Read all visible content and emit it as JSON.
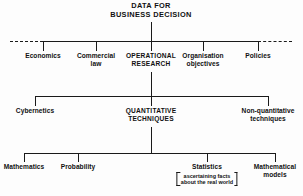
{
  "diagram": {
    "line_color": "#1a1a1a",
    "background": "#fdfdfd",
    "root": {
      "line1": "DATA FOR",
      "line2": "BUSINESS DECISION"
    },
    "level1": {
      "items": [
        {
          "line1": "Economics",
          "line2": ""
        },
        {
          "line1": "Commercial",
          "line2": "law"
        },
        {
          "line1": "OPERATIONAL",
          "line2": "RESEARCH"
        },
        {
          "line1": "Organisation",
          "line2": "objectives"
        },
        {
          "line1": "Policies",
          "line2": ""
        }
      ]
    },
    "level2": {
      "items": [
        {
          "line1": "Cybernetics",
          "line2": ""
        },
        {
          "line1": "QUANTITATIVE",
          "line2": "TECHNIQUES"
        },
        {
          "line1": "Non-quantitative",
          "line2": "techniques"
        }
      ]
    },
    "level3": {
      "items": [
        {
          "line1": "Mathematics",
          "line2": ""
        },
        {
          "line1": "Probability",
          "line2": ""
        },
        {
          "line1": "Statistics",
          "line2": ""
        },
        {
          "line1": "Mathematical",
          "line2": "models"
        }
      ],
      "statistics_note": {
        "line1": "ascertaining facts",
        "line2": "about the real world"
      }
    }
  }
}
